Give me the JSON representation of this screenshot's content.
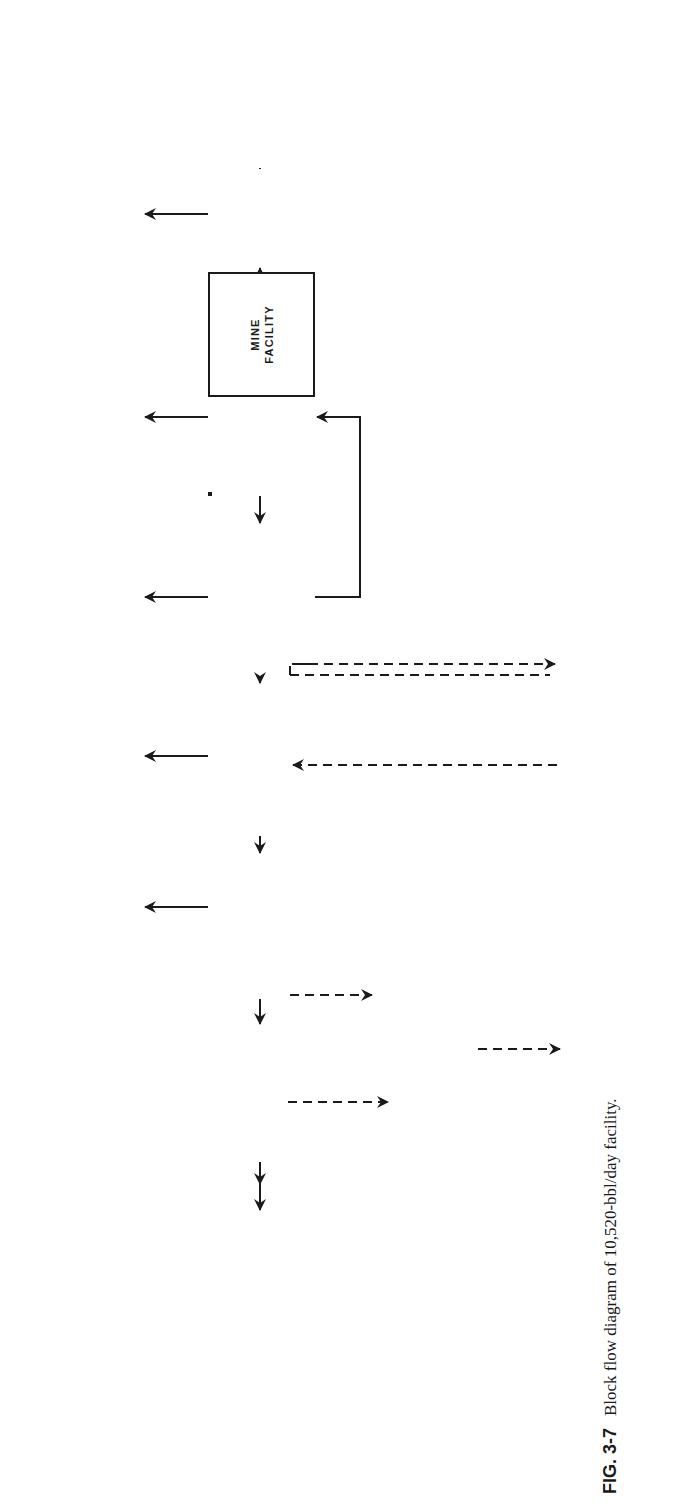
{
  "figure": {
    "number": "FIG. 3-7",
    "caption": "Block flow diagram of 10,520-bbl/day facility."
  },
  "colors": {
    "ink": "#1a1a1a",
    "paper": "#ffffff"
  },
  "blocks": {
    "mine_facility": "MINE\nFACILITY",
    "secondary_crushing": "SECONDARY\nCRUSHING,\nSCREENING,\n&\nMATERIAL\nHANDLING",
    "retort": "RETORT",
    "oil_gas_recovery": "OIL & GAS\nRECOVERY",
    "ammonia_removal": "AMMONIA\nREMOVAL",
    "sulfur_removal": "SULFUR\nREMOVAL",
    "alt2_naphtha": "ALT # II\nNAPHTHA\nRECOVERY",
    "flare": "FLARE",
    "fines_disposal": "FINES\nDISPOSAL",
    "spent_shale_disposal": "SPENT-\nSHALE\nDISPOSAL",
    "oil_storage": "OIL\nSTORAGE",
    "ammonia_storage": "AMMONIA\nSTORAGE",
    "sulfur_storage": "SULFUR\nSTORAGE",
    "export": "EXPORT",
    "alt3_power": "ALT # III\nPOWER\nGENERATION",
    "distribution_export": "DISTRIBUTION\n&\nEXPORT",
    "alt1_cos": "ALT # I\nCOS HYDROLYSIS",
    "common_utilities": "COMMON\nUTILITIES",
    "common_offsite": "COMMON\nOFFSITE\nAUXILIARIES"
  },
  "edge_labels": {
    "recycle_gas": "RECYCLE GAS"
  },
  "edges": [
    {
      "from": "MINE FACILITY",
      "to": "SECONDARY CRUSHING, SCREENING, & MATERIAL HANDLING",
      "style": "solid"
    },
    {
      "from": "SECONDARY CRUSHING, SCREENING, & MATERIAL HANDLING",
      "to": "RETORT",
      "style": "solid"
    },
    {
      "from": "SECONDARY CRUSHING, SCREENING, & MATERIAL HANDLING",
      "to": "FINES DISPOSAL",
      "style": "solid"
    },
    {
      "from": "RETORT",
      "to": "OIL & GAS RECOVERY",
      "style": "solid"
    },
    {
      "from": "RETORT",
      "to": "SPENT-SHALE DISPOSAL",
      "style": "solid"
    },
    {
      "from": "OIL & GAS RECOVERY",
      "to": "RETORT",
      "style": "solid",
      "label": "RECYCLE GAS"
    },
    {
      "from": "OIL & GAS RECOVERY",
      "to": "OIL STORAGE",
      "style": "solid"
    },
    {
      "from": "OIL & GAS RECOVERY",
      "to": "AMMONIA REMOVAL",
      "style": "solid"
    },
    {
      "from": "OIL & GAS RECOVERY",
      "to": "ALT # I COS HYDROLYSIS",
      "style": "dashed"
    },
    {
      "from": "ALT # I COS HYDROLYSIS",
      "to": "AMMONIA REMOVAL",
      "style": "dashed"
    },
    {
      "from": "AMMONIA REMOVAL",
      "to": "AMMONIA STORAGE",
      "style": "solid"
    },
    {
      "from": "AMMONIA REMOVAL",
      "to": "SULFUR REMOVAL",
      "style": "solid"
    },
    {
      "from": "SULFUR REMOVAL",
      "to": "SULFUR STORAGE",
      "style": "solid"
    },
    {
      "from": "SULFUR REMOVAL",
      "to": "ALT # II NAPHTHA RECOVERY",
      "style": "solid"
    },
    {
      "from": "SULFUR REMOVAL",
      "to": "ALT # III POWER GENERATION",
      "style": "dashed"
    },
    {
      "from": "ALT # III POWER GENERATION",
      "to": "DISTRIBUTION & EXPORT",
      "style": "dashed"
    },
    {
      "from": "ALT # II NAPHTHA RECOVERY",
      "to": "FLARE",
      "style": "solid"
    },
    {
      "from": "ALT # II NAPHTHA RECOVERY",
      "to": "EXPORT",
      "style": "dashed"
    }
  ]
}
